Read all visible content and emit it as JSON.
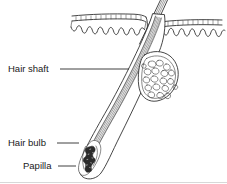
{
  "figure": {
    "background_color": "#ffffff",
    "ink_color": "#262626",
    "width": 227,
    "height": 184
  },
  "labels": [
    {
      "id": "hair-shaft",
      "text": "Hair shaft",
      "text_x": 8,
      "text_y": 72,
      "leader_x1": 60,
      "leader_y1": 69,
      "leader_x2": 129,
      "leader_y2": 69
    },
    {
      "id": "hair-bulb",
      "text": "Hair bulb",
      "text_x": 8,
      "text_y": 146,
      "leader_x1": 57,
      "leader_y1": 143,
      "leader_x2": 79,
      "leader_y2": 143
    },
    {
      "id": "papilla",
      "text": "Papilla",
      "text_x": 23,
      "text_y": 169,
      "leader_x1": 58,
      "leader_y1": 166,
      "leader_x2": 76,
      "leader_y2": 166
    }
  ],
  "structures": {
    "epidermis_left": "hatched band with cell tick marks, left of hair",
    "epidermis_right": "hatched band with cell tick marks, right of hair",
    "dermal_wave_left": "scalloped dermal-epidermal junction, left",
    "dermal_wave_right": "scalloped dermal-epidermal junction, right",
    "hair_shaft": "hair emerging above skin surface at upper right",
    "follicle": "obliquely angled follicle sheath running lower-left",
    "sebaceous_gland": "lobed stippled gland attached to follicle",
    "hair_bulb": "rounded base of follicle",
    "papilla": "dark stippled dermal papilla inside the bulb"
  }
}
